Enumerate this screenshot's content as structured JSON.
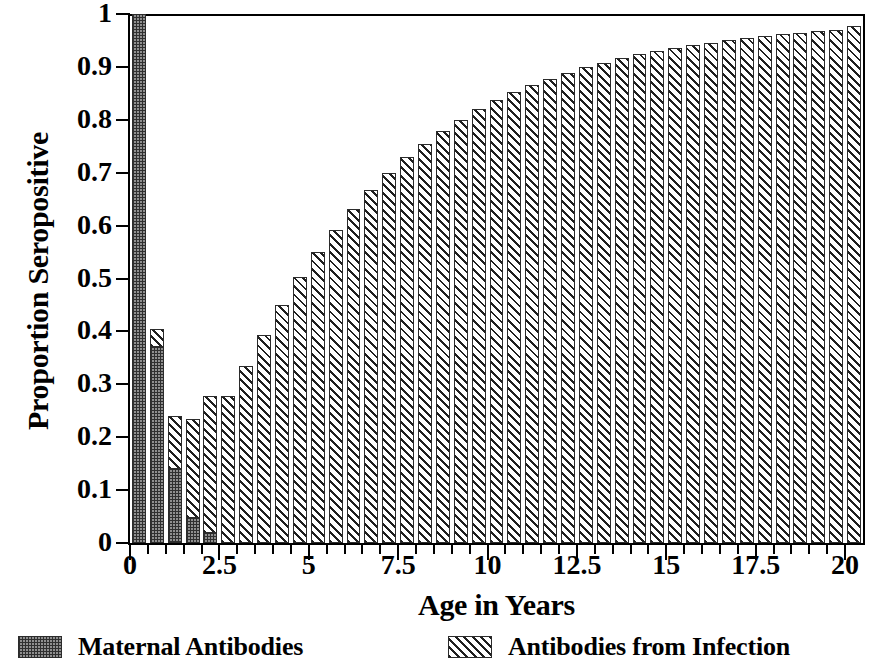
{
  "chart_data": {
    "type": "bar",
    "stacked": true,
    "title": "",
    "xlabel": "Age in Years",
    "ylabel": "Proportion Seropositive",
    "xlim": [
      0,
      20.5
    ],
    "ylim": [
      0,
      1
    ],
    "grid": false,
    "legend_position": "bottom",
    "x": [
      0,
      0.5,
      1,
      1.5,
      2,
      2.5,
      3,
      3.5,
      4,
      4.5,
      5,
      5.5,
      6,
      6.5,
      7,
      7.5,
      8,
      8.5,
      9,
      9.5,
      10,
      10.5,
      11,
      11.5,
      12,
      12.5,
      13,
      13.5,
      14,
      14.5,
      15,
      15.5,
      16,
      16.5,
      17,
      17.5,
      18,
      18.5,
      19,
      19.5,
      20
    ],
    "series": [
      {
        "name": "Maternal Antibodies",
        "pattern": "stipple-dark",
        "values": [
          1.0,
          0.37,
          0.14,
          0.048,
          0.018,
          0,
          0,
          0,
          0,
          0,
          0,
          0,
          0,
          0,
          0,
          0,
          0,
          0,
          0,
          0,
          0,
          0,
          0,
          0,
          0,
          0,
          0,
          0,
          0,
          0,
          0,
          0,
          0,
          0,
          0,
          0,
          0,
          0,
          0,
          0,
          0
        ]
      },
      {
        "name": "Antibodies from Infection",
        "pattern": "diagonal-hatch",
        "values": [
          0,
          0.035,
          0.1,
          0.187,
          0.259,
          0.277,
          0.335,
          0.394,
          0.45,
          0.502,
          0.55,
          0.592,
          0.632,
          0.667,
          0.7,
          0.729,
          0.755,
          0.779,
          0.8,
          0.82,
          0.837,
          0.852,
          0.866,
          0.878,
          0.889,
          0.899,
          0.908,
          0.916,
          0.924,
          0.93,
          0.936,
          0.941,
          0.946,
          0.951,
          0.955,
          0.958,
          0.962,
          0.965,
          0.968,
          0.97,
          0.978
        ]
      }
    ],
    "totals": [
      1.0,
      0.405,
      0.24,
      0.235,
      0.277,
      0.277,
      0.335,
      0.394,
      0.45,
      0.502,
      0.55,
      0.592,
      0.632,
      0.667,
      0.7,
      0.729,
      0.755,
      0.779,
      0.8,
      0.82,
      0.837,
      0.852,
      0.866,
      0.878,
      0.889,
      0.899,
      0.908,
      0.916,
      0.924,
      0.93,
      0.936,
      0.941,
      0.946,
      0.951,
      0.955,
      0.958,
      0.962,
      0.965,
      0.968,
      0.97,
      0.978
    ],
    "yticks": [
      0,
      0.1,
      0.2,
      0.3,
      0.4,
      0.5,
      0.6,
      0.7,
      0.8,
      0.9,
      1
    ],
    "ytick_labels": [
      "0",
      "0.1",
      "0.2",
      "0.3",
      "0.4",
      "0.5",
      "0.6",
      "0.7",
      "0.8",
      "0.9",
      "1"
    ],
    "xticks": [
      0,
      2.5,
      5,
      7.5,
      10,
      12.5,
      15,
      17.5,
      20
    ],
    "xtick_labels": [
      "0",
      "2.5",
      "5",
      "7.5",
      "10",
      "12.5",
      "15",
      "17.5",
      "20"
    ],
    "xminor_step": 0.5,
    "colors": {
      "maternal_fill": "#8f8f8f",
      "maternal_ink": "#2f2f2f",
      "infection_fill": "#ffffff",
      "infection_ink": "#1f1f1f",
      "axis": "#000000",
      "background": "#ffffff"
    }
  },
  "legend": {
    "entries": [
      {
        "label": "Maternal Antibodies",
        "swatch": "stipple-dark-swatch"
      },
      {
        "label": "Antibodies from Infection",
        "swatch": "diagonal-hatch-swatch"
      }
    ]
  }
}
